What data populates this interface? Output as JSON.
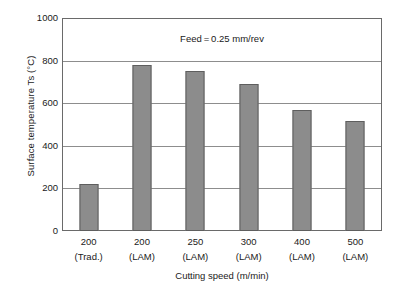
{
  "chart_data": {
    "type": "bar",
    "title": "",
    "xlabel": "Cutting speed (m/min)",
    "ylabel": "Surface temperature Ts (°C)",
    "annotation": "Feed = 0.25 mm/rev",
    "ylim": [
      0,
      1000
    ],
    "yticks": [
      1000,
      800,
      600,
      400,
      200,
      0
    ],
    "ytick_labels": [
      "1000",
      "800",
      "600",
      "400",
      "200",
      "0"
    ],
    "grid": "horizontal",
    "legend": "none",
    "bar_color": "#8c8c8c",
    "bar_edge_color": "#5e5e5e",
    "axis_color": "#6a6a6a",
    "categories": [
      {
        "speed": "200",
        "method": "(Trad.)"
      },
      {
        "speed": "200",
        "method": "(LAM)"
      },
      {
        "speed": "250",
        "method": "(LAM)"
      },
      {
        "speed": "300",
        "method": "(LAM)"
      },
      {
        "speed": "400",
        "method": "(LAM)"
      },
      {
        "speed": "500",
        "method": "(LAM)"
      }
    ],
    "values": [
      222,
      780,
      750,
      690,
      570,
      515
    ]
  }
}
